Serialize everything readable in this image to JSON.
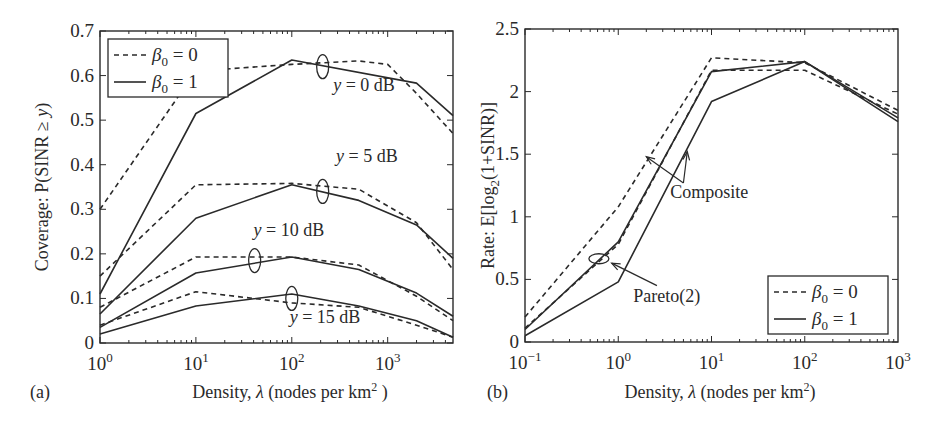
{
  "chart_data": [
    {
      "panel_label": "(a)",
      "type": "line",
      "xscale": "log",
      "xlabel": "Density, λ (nodes per km² )",
      "ylabel": "Coverage: P(SINR ≥ y)",
      "xlim": [
        1,
        4800
      ],
      "ylim": [
        0,
        0.7
      ],
      "xticks": [
        {
          "v": 1,
          "label": "10",
          "exp": "0"
        },
        {
          "v": 10,
          "label": "10",
          "exp": "1"
        },
        {
          "v": 100,
          "label": "10",
          "exp": "2"
        },
        {
          "v": 1000,
          "label": "10",
          "exp": "3"
        }
      ],
      "yticks": [
        0,
        0.1,
        0.2,
        0.3,
        0.4,
        0.5,
        0.6,
        0.7
      ],
      "ytick_labels": [
        "0",
        "0.1",
        "0.2",
        "0.3",
        "0.4",
        "0.5",
        "0.6",
        "0.7"
      ],
      "grid": false,
      "legend": {
        "position": "upper-left",
        "entries": [
          {
            "label": "β₀ = 0",
            "style": "dashed"
          },
          {
            "label": "β₀ = 1",
            "style": "solid"
          }
        ]
      },
      "series": [
        {
          "name": "β₀=0, y=0 dB",
          "style": "dashed",
          "x": [
            1,
            10,
            100,
            500,
            1000,
            2000,
            4800
          ],
          "y": [
            0.3,
            0.61,
            0.625,
            0.633,
            0.625,
            0.56,
            0.47
          ]
        },
        {
          "name": "β₀=1, y=0 dB",
          "style": "solid",
          "x": [
            1,
            10,
            100,
            2000,
            4800
          ],
          "y": [
            0.11,
            0.515,
            0.635,
            0.583,
            0.51
          ]
        },
        {
          "name": "β₀=0, y=5 dB",
          "style": "dashed",
          "x": [
            1,
            10,
            100,
            500,
            2000,
            4800
          ],
          "y": [
            0.15,
            0.355,
            0.358,
            0.345,
            0.27,
            0.165
          ]
        },
        {
          "name": "β₀=1, y=5 dB",
          "style": "solid",
          "x": [
            1,
            10,
            100,
            500,
            2000,
            4800
          ],
          "y": [
            0.065,
            0.28,
            0.355,
            0.32,
            0.265,
            0.19
          ]
        },
        {
          "name": "β₀=0, y=10 dB",
          "style": "dashed",
          "x": [
            1,
            10,
            100,
            500,
            2000,
            4800
          ],
          "y": [
            0.08,
            0.193,
            0.193,
            0.175,
            0.105,
            0.05
          ]
        },
        {
          "name": "β₀=1, y=10 dB",
          "style": "solid",
          "x": [
            1,
            10,
            100,
            500,
            2000,
            4800
          ],
          "y": [
            0.035,
            0.157,
            0.193,
            0.165,
            0.112,
            0.06
          ]
        },
        {
          "name": "β₀=0, y=15 dB",
          "style": "dashed",
          "x": [
            1,
            10,
            100,
            500,
            2000,
            4800
          ],
          "y": [
            0.04,
            0.115,
            0.09,
            0.08,
            0.04,
            0.013
          ]
        },
        {
          "name": "β₀=1, y=15 dB",
          "style": "solid",
          "x": [
            1,
            10,
            100,
            500,
            2000,
            4800
          ],
          "y": [
            0.02,
            0.083,
            0.11,
            0.083,
            0.05,
            0.013
          ]
        }
      ],
      "annotations": [
        {
          "text_pre": "y",
          "text": " = 0 dB",
          "x": 270,
          "y": 0.565
        },
        {
          "text_pre": "y",
          "text": " = 5 dB",
          "x": 290,
          "y": 0.405
        },
        {
          "text_pre": "y",
          "text": " = 10 dB",
          "x": 40,
          "y": 0.24
        },
        {
          "text_pre": "y",
          "text": " = 15 dB",
          "x": 95,
          "y": 0.045
        }
      ],
      "ellipses": [
        {
          "x": 210,
          "y": 0.62,
          "rx": 6,
          "ry": 12
        },
        {
          "x": 210,
          "y": 0.34,
          "rx": 6,
          "ry": 12
        },
        {
          "x": 41,
          "y": 0.185,
          "rx": 6,
          "ry": 12
        },
        {
          "x": 100,
          "y": 0.1,
          "rx": 6,
          "ry": 12
        }
      ]
    },
    {
      "panel_label": "(b)",
      "type": "line",
      "xscale": "log",
      "xlabel": "Density, λ (nodes per km²)",
      "ylabel": "Rate: E[log₂(1+SINR)]",
      "xlim": [
        0.1,
        1000
      ],
      "ylim": [
        0,
        2.5
      ],
      "xticks": [
        {
          "v": 0.1,
          "label": "10",
          "exp": "−1"
        },
        {
          "v": 1,
          "label": "10",
          "exp": "0"
        },
        {
          "v": 10,
          "label": "10",
          "exp": "1"
        },
        {
          "v": 100,
          "label": "10",
          "exp": "2"
        },
        {
          "v": 1000,
          "label": "10",
          "exp": "3"
        }
      ],
      "yticks": [
        0,
        0.5,
        1,
        1.5,
        2,
        2.5
      ],
      "ytick_labels": [
        "0",
        "0.5",
        "1",
        "1.5",
        "2",
        "2.5"
      ],
      "grid": false,
      "legend": {
        "position": "lower-right",
        "entries": [
          {
            "label": "β₀ = 0",
            "style": "dashed"
          },
          {
            "label": "β₀ = 1",
            "style": "solid"
          }
        ]
      },
      "series": [
        {
          "name": "Composite, β₀=0",
          "style": "dashed",
          "x": [
            0.1,
            1,
            10,
            100,
            1000
          ],
          "y": [
            0.2,
            1.08,
            2.27,
            2.23,
            1.85
          ]
        },
        {
          "name": "Composite, β₀=1",
          "style": "solid",
          "x": [
            0.1,
            1,
            10,
            100,
            1000
          ],
          "y": [
            0.05,
            0.48,
            1.92,
            2.24,
            1.76
          ]
        },
        {
          "name": "Pareto(2), β₀=0",
          "style": "dashed",
          "x": [
            0.1,
            1,
            10,
            100,
            1000
          ],
          "y": [
            0.11,
            0.78,
            2.17,
            2.17,
            1.82
          ]
        },
        {
          "name": "Pareto(2), β₀=1",
          "style": "solid",
          "x": [
            0.1,
            1,
            10,
            100,
            1000
          ],
          "y": [
            0.1,
            0.8,
            2.16,
            2.24,
            1.79
          ]
        }
      ],
      "annotations": [
        {
          "text": "Composite",
          "x": 3.6,
          "y": 1.15
        },
        {
          "text": "Pareto(2)",
          "x": 1.45,
          "y": 0.32
        }
      ],
      "arrows": [
        {
          "from": [
            5.0,
            1.27
          ],
          "to": [
            2.0,
            1.48
          ]
        },
        {
          "from": [
            5.0,
            1.27
          ],
          "to": [
            5.5,
            1.52
          ]
        },
        {
          "from": [
            2.6,
            0.45
          ],
          "to": [
            0.85,
            0.63
          ]
        }
      ],
      "ellipses": [
        {
          "x": 0.62,
          "y": 0.665,
          "rx": 10,
          "ry": 5
        }
      ]
    }
  ]
}
